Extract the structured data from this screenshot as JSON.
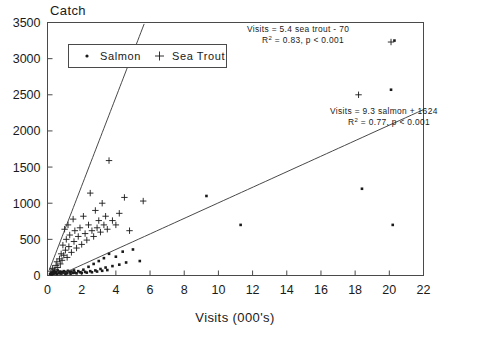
{
  "chart_data": {
    "type": "scatter",
    "title": "",
    "ylabel": "Catch",
    "xlabel": "Visits (000's)",
    "xlim": [
      0,
      22
    ],
    "ylim": [
      0,
      3500
    ],
    "xticks": [
      0,
      2,
      4,
      6,
      8,
      10,
      12,
      14,
      16,
      18,
      20,
      22
    ],
    "xtick_labels": [
      "0",
      "2",
      "4",
      "6",
      "8",
      "10",
      "12",
      "14",
      "16",
      "18",
      "20",
      "22"
    ],
    "yticks": [
      0,
      500,
      1000,
      1500,
      2000,
      2500,
      3000,
      3500
    ],
    "ytick_labels": [
      "0",
      "500",
      "1000",
      "1500",
      "2000",
      "2500",
      "3000",
      "3500"
    ],
    "grid": false,
    "legend_position": "top-left",
    "series": [
      {
        "name": "Salmon",
        "marker": "dot",
        "points": [
          [
            0.15,
            20
          ],
          [
            0.2,
            35
          ],
          [
            0.25,
            15
          ],
          [
            0.3,
            45
          ],
          [
            0.35,
            25
          ],
          [
            0.4,
            60
          ],
          [
            0.45,
            30
          ],
          [
            0.5,
            50
          ],
          [
            0.55,
            20
          ],
          [
            0.6,
            70
          ],
          [
            0.65,
            40
          ],
          [
            0.7,
            30
          ],
          [
            0.75,
            55
          ],
          [
            0.8,
            25
          ],
          [
            0.85,
            45
          ],
          [
            0.9,
            35
          ],
          [
            0.95,
            60
          ],
          [
            1.0,
            40
          ],
          [
            1.05,
            20
          ],
          [
            1.1,
            50
          ],
          [
            1.15,
            30
          ],
          [
            1.2,
            65
          ],
          [
            1.3,
            45
          ],
          [
            1.35,
            25
          ],
          [
            1.4,
            55
          ],
          [
            1.5,
            35
          ],
          [
            1.55,
            70
          ],
          [
            1.6,
            40
          ],
          [
            1.7,
            30
          ],
          [
            1.8,
            60
          ],
          [
            1.9,
            45
          ],
          [
            2.0,
            35
          ],
          [
            2.1,
            80
          ],
          [
            2.2,
            50
          ],
          [
            2.3,
            40
          ],
          [
            2.4,
            120
          ],
          [
            2.5,
            60
          ],
          [
            2.6,
            45
          ],
          [
            2.7,
            160
          ],
          [
            2.8,
            70
          ],
          [
            2.9,
            55
          ],
          [
            3.0,
            200
          ],
          [
            3.1,
            90
          ],
          [
            3.2,
            65
          ],
          [
            3.3,
            240
          ],
          [
            3.4,
            110
          ],
          [
            3.5,
            75
          ],
          [
            3.6,
            300
          ],
          [
            3.8,
            130
          ],
          [
            4.0,
            260
          ],
          [
            4.2,
            150
          ],
          [
            4.4,
            330
          ],
          [
            4.6,
            180
          ],
          [
            5.0,
            360
          ],
          [
            5.4,
            200
          ],
          [
            9.3,
            1100
          ],
          [
            11.3,
            700
          ],
          [
            18.4,
            1200
          ],
          [
            20.2,
            700
          ],
          [
            20.3,
            3250
          ],
          [
            20.1,
            2570
          ]
        ]
      },
      {
        "name": "Sea Trout",
        "marker": "plus",
        "points": [
          [
            0.2,
            60
          ],
          [
            0.3,
            100
          ],
          [
            0.4,
            80
          ],
          [
            0.5,
            140
          ],
          [
            0.55,
            190
          ],
          [
            0.6,
            110
          ],
          [
            0.7,
            230
          ],
          [
            0.75,
            160
          ],
          [
            0.8,
            300
          ],
          [
            0.85,
            210
          ],
          [
            0.9,
            420
          ],
          [
            0.95,
            280
          ],
          [
            1.0,
            640
          ],
          [
            1.05,
            350
          ],
          [
            1.1,
            500
          ],
          [
            1.15,
            250
          ],
          [
            1.2,
            700
          ],
          [
            1.25,
            400
          ],
          [
            1.3,
            560
          ],
          [
            1.4,
            320
          ],
          [
            1.5,
            780
          ],
          [
            1.55,
            470
          ],
          [
            1.6,
            620
          ],
          [
            1.7,
            380
          ],
          [
            1.8,
            540
          ],
          [
            1.9,
            660
          ],
          [
            2.0,
            430
          ],
          [
            2.1,
            820
          ],
          [
            2.2,
            580
          ],
          [
            2.3,
            490
          ],
          [
            2.4,
            700
          ],
          [
            2.5,
            1140
          ],
          [
            2.6,
            620
          ],
          [
            2.7,
            540
          ],
          [
            2.8,
            900
          ],
          [
            2.9,
            660
          ],
          [
            3.0,
            760
          ],
          [
            3.1,
            600
          ],
          [
            3.2,
            1000
          ],
          [
            3.3,
            700
          ],
          [
            3.4,
            820
          ],
          [
            3.5,
            640
          ],
          [
            3.6,
            1590
          ],
          [
            3.8,
            760
          ],
          [
            4.0,
            700
          ],
          [
            4.2,
            860
          ],
          [
            4.5,
            1080
          ],
          [
            4.8,
            620
          ],
          [
            5.6,
            1030
          ],
          [
            18.2,
            2500
          ],
          [
            20.1,
            3230
          ]
        ]
      }
    ],
    "fits": [
      {
        "name": "sea-trout-fit",
        "equation": "Visits = 5.4 sea trout - 70",
        "r2_text": "R",
        "r2_sup": "2",
        "stats": "= 0.83, p < 0.001",
        "slope": 613.0,
        "intercept": 13.0,
        "x_from": 0.1,
        "x_to": 5.75
      },
      {
        "name": "salmon-fit",
        "equation": "Visits = 9.3 salmon + 1624",
        "r2_text": "R",
        "r2_sup": "2",
        "stats": "= 0.77, p < 0.001",
        "slope": 107.5,
        "intercept": -70.0,
        "x_from": 0.7,
        "x_to": 22.0
      }
    ]
  },
  "legend": {
    "items": [
      {
        "label": "Salmon",
        "marker": "dot"
      },
      {
        "label": "Sea Trout",
        "marker": "plus"
      }
    ]
  },
  "annotations": {
    "trout": {
      "line1": "Visits = 5.4 sea trout - 70",
      "r2_prefix": "R",
      "r2_sup": "2",
      "line2_rest": "= 0.83, p < 0.001"
    },
    "salmon": {
      "line1": "Visits = 9.3 salmon + 1624",
      "r2_prefix": "R",
      "r2_sup": "2",
      "line2_rest": "= 0.77, p < 0.001"
    }
  },
  "colors": {
    "ink": "#1a1a1a",
    "frame": "#4a4a4a",
    "background": "#ffffff"
  }
}
